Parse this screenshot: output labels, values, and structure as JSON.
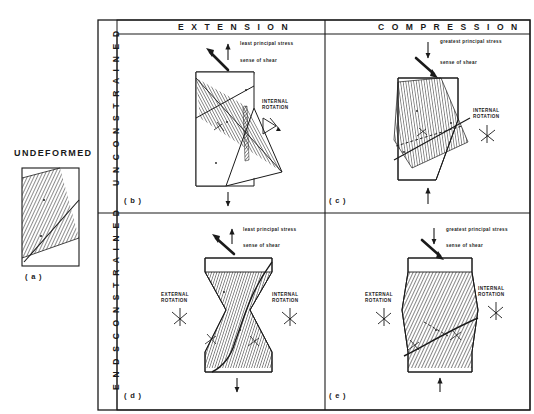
{
  "figure": {
    "column_headers": [
      {
        "id": "extension",
        "label": "E X T E N S I O N"
      },
      {
        "id": "compression",
        "label": "C O M P R E S S I O N"
      }
    ],
    "row_headers": [
      {
        "id": "unconstrained",
        "label": "U N C O N S T R A I N E D"
      },
      {
        "id": "ends-constrained",
        "label": "E N D S   C O N S T R A I N E D"
      }
    ],
    "undeformed": {
      "title": "UNDEFORMED",
      "panel_label": "( a )",
      "marks": [
        "S",
        "P"
      ]
    },
    "panels": [
      {
        "id": "b",
        "panel_label": "( b )",
        "column": "extension",
        "row": "unconstrained",
        "stress_label": "least principal stress",
        "shear_label": "sense of shear",
        "stress_arrow": "up",
        "rotations": [
          {
            "id": "internal",
            "line1": "INTERNAL",
            "line2": "ROTATION"
          }
        ],
        "marks": [
          "P",
          "S",
          "T"
        ]
      },
      {
        "id": "c",
        "panel_label": "( c )",
        "column": "compression",
        "row": "unconstrained",
        "stress_label": "greatest principal stress",
        "shear_label": "sense of shear",
        "stress_arrow": "down",
        "rotations": [
          {
            "id": "internal",
            "line1": "INTERNAL",
            "line2": "ROTATION"
          }
        ],
        "marks": [
          "P",
          "S",
          "T"
        ]
      },
      {
        "id": "d",
        "panel_label": "( d )",
        "column": "extension",
        "row": "ends-constrained",
        "stress_label": "least principal stress",
        "shear_label": "sense of shear",
        "stress_arrow": "up",
        "rotations": [
          {
            "id": "external",
            "line1": "EXTERNAL",
            "line2": "ROTATION"
          },
          {
            "id": "internal",
            "line1": "INTERNAL",
            "line2": "ROTATION"
          }
        ],
        "marks": [
          "P",
          "S",
          "T"
        ]
      },
      {
        "id": "e",
        "panel_label": "( e )",
        "column": "compression",
        "row": "ends-constrained",
        "stress_label": "greatest principal stress",
        "shear_label": "sense of shear",
        "stress_arrow": "down",
        "rotations": [
          {
            "id": "external",
            "line1": "EXTERNAL",
            "line2": "ROTATION"
          },
          {
            "id": "internal",
            "line1": "INTERNAL",
            "line2": "ROTATION"
          }
        ],
        "marks": [
          "P",
          "S",
          "T"
        ]
      }
    ],
    "colors": {
      "ink": "#1a1a1a",
      "hatch": "#3a3a3a",
      "background": "#ffffff"
    }
  }
}
